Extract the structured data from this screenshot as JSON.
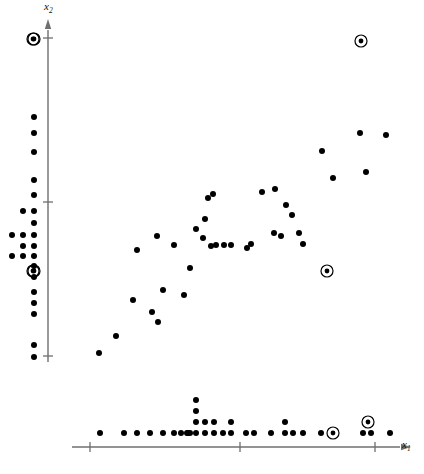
{
  "figure": {
    "title": "",
    "axis_labels": {
      "x": "x",
      "x_sub": "1",
      "y": "x",
      "y_sub": "2"
    },
    "colors": {
      "point": "#000000",
      "axis": "#6f6f6f",
      "tick": "#6f6f6f",
      "background": "#ffffff",
      "outlier_ring": "#000000"
    }
  },
  "chart_data": {
    "type": "scatter",
    "title": "",
    "xlabel": "x1",
    "ylabel": "x2",
    "grid": false,
    "legend": null,
    "xlim": [
      0,
      424
    ],
    "ylim": [
      0,
      474
    ],
    "axes": {
      "y_axis_x_px": 48,
      "y_axis_top_px": 30,
      "y_axis_bottom_px": 362,
      "y_ticks_px": [
        38,
        202,
        356
      ],
      "x_axis_y_px": 447,
      "x_axis_left_px": 72,
      "x_axis_right_px": 400,
      "x_ticks_px": [
        90,
        240,
        375
      ]
    },
    "main_points": [
      {
        "x": 99,
        "y": 353,
        "outlier": false
      },
      {
        "x": 116,
        "y": 336,
        "outlier": false
      },
      {
        "x": 133,
        "y": 300,
        "outlier": false
      },
      {
        "x": 137,
        "y": 250,
        "outlier": false
      },
      {
        "x": 152,
        "y": 312,
        "outlier": false
      },
      {
        "x": 157,
        "y": 236,
        "outlier": false
      },
      {
        "x": 158,
        "y": 322,
        "outlier": false
      },
      {
        "x": 163,
        "y": 290,
        "outlier": false
      },
      {
        "x": 174,
        "y": 245,
        "outlier": false
      },
      {
        "x": 184,
        "y": 295,
        "outlier": false
      },
      {
        "x": 190,
        "y": 268,
        "outlier": false
      },
      {
        "x": 196,
        "y": 229,
        "outlier": false
      },
      {
        "x": 203,
        "y": 238,
        "outlier": false
      },
      {
        "x": 205,
        "y": 219,
        "outlier": false
      },
      {
        "x": 208,
        "y": 198,
        "outlier": false
      },
      {
        "x": 211,
        "y": 246,
        "outlier": false
      },
      {
        "x": 213,
        "y": 194,
        "outlier": false
      },
      {
        "x": 216,
        "y": 245,
        "outlier": false
      },
      {
        "x": 224,
        "y": 245,
        "outlier": false
      },
      {
        "x": 231,
        "y": 245,
        "outlier": false
      },
      {
        "x": 247,
        "y": 248,
        "outlier": false
      },
      {
        "x": 251,
        "y": 244,
        "outlier": false
      },
      {
        "x": 262,
        "y": 192,
        "outlier": false
      },
      {
        "x": 274,
        "y": 233,
        "outlier": false
      },
      {
        "x": 275,
        "y": 189,
        "outlier": false
      },
      {
        "x": 281,
        "y": 236,
        "outlier": false
      },
      {
        "x": 286,
        "y": 205,
        "outlier": false
      },
      {
        "x": 292,
        "y": 215,
        "outlier": false
      },
      {
        "x": 299,
        "y": 233,
        "outlier": false
      },
      {
        "x": 303,
        "y": 244,
        "outlier": false
      },
      {
        "x": 322,
        "y": 151,
        "outlier": false
      },
      {
        "x": 333,
        "y": 178,
        "outlier": false
      },
      {
        "x": 360,
        "y": 133,
        "outlier": false
      },
      {
        "x": 366,
        "y": 172,
        "outlier": false
      },
      {
        "x": 386,
        "y": 135,
        "outlier": false
      },
      {
        "x": 361,
        "y": 41,
        "outlier": true
      },
      {
        "x": 327,
        "y": 271,
        "outlier": true
      },
      {
        "x": 33,
        "y": 271,
        "outlier": true
      },
      {
        "x": 33,
        "y": 39,
        "outlier": true
      }
    ],
    "y_marginal_dots": [
      {
        "col": 0,
        "y": 39,
        "outlier": true
      },
      {
        "col": 0,
        "y": 117,
        "outlier": false
      },
      {
        "col": 0,
        "y": 133,
        "outlier": false
      },
      {
        "col": 0,
        "y": 152,
        "outlier": false
      },
      {
        "col": 0,
        "y": 180,
        "outlier": false
      },
      {
        "col": 0,
        "y": 195,
        "outlier": false
      },
      {
        "col": 1,
        "y": 211,
        "outlier": false
      },
      {
        "col": 0,
        "y": 211,
        "outlier": false
      },
      {
        "col": 0,
        "y": 223,
        "outlier": false
      },
      {
        "col": 0,
        "y": 235,
        "outlier": false
      },
      {
        "col": 1,
        "y": 235,
        "outlier": false
      },
      {
        "col": 2,
        "y": 235,
        "outlier": false
      },
      {
        "col": 0,
        "y": 246,
        "outlier": false
      },
      {
        "col": 1,
        "y": 246,
        "outlier": false
      },
      {
        "col": 0,
        "y": 256,
        "outlier": false
      },
      {
        "col": 1,
        "y": 256,
        "outlier": false
      },
      {
        "col": 2,
        "y": 256,
        "outlier": false
      },
      {
        "col": 0,
        "y": 266,
        "outlier": false
      },
      {
        "col": 0,
        "y": 277,
        "outlier": false
      },
      {
        "col": 0,
        "y": 271,
        "outlier": true
      },
      {
        "col": 0,
        "y": 292,
        "outlier": false
      },
      {
        "col": 0,
        "y": 303,
        "outlier": false
      },
      {
        "col": 0,
        "y": 314,
        "outlier": false
      },
      {
        "col": 0,
        "y": 345,
        "outlier": false
      },
      {
        "col": 0,
        "y": 357,
        "outlier": false
      }
    ],
    "x_marginal_dots": [
      {
        "x": 100,
        "row": 0,
        "outlier": false
      },
      {
        "x": 124,
        "row": 0,
        "outlier": false
      },
      {
        "x": 137,
        "row": 0,
        "outlier": false
      },
      {
        "x": 150,
        "row": 0,
        "outlier": false
      },
      {
        "x": 163,
        "row": 0,
        "outlier": false
      },
      {
        "x": 174,
        "row": 0,
        "outlier": false
      },
      {
        "x": 181,
        "row": 0,
        "outlier": false
      },
      {
        "x": 188,
        "row": 0,
        "outlier": false
      },
      {
        "x": 196,
        "row": 0,
        "outlier": false
      },
      {
        "x": 190,
        "row": 0,
        "outlier": false
      },
      {
        "x": 187,
        "row": 0,
        "outlier": false
      },
      {
        "x": 196,
        "row": 1,
        "outlier": false
      },
      {
        "x": 196,
        "row": 2,
        "outlier": false
      },
      {
        "x": 196,
        "row": 3,
        "outlier": false
      },
      {
        "x": 205,
        "row": 0,
        "outlier": false
      },
      {
        "x": 205,
        "row": 1,
        "outlier": false
      },
      {
        "x": 214,
        "row": 0,
        "outlier": false
      },
      {
        "x": 214,
        "row": 1,
        "outlier": false
      },
      {
        "x": 223,
        "row": 0,
        "outlier": false
      },
      {
        "x": 231,
        "row": 0,
        "outlier": false
      },
      {
        "x": 231,
        "row": 1,
        "outlier": false
      },
      {
        "x": 246,
        "row": 0,
        "outlier": false
      },
      {
        "x": 254,
        "row": 0,
        "outlier": false
      },
      {
        "x": 271,
        "row": 0,
        "outlier": false
      },
      {
        "x": 285,
        "row": 0,
        "outlier": false
      },
      {
        "x": 285,
        "row": 1,
        "outlier": false
      },
      {
        "x": 293,
        "row": 0,
        "outlier": false
      },
      {
        "x": 303,
        "row": 0,
        "outlier": false
      },
      {
        "x": 321,
        "row": 0,
        "outlier": false
      },
      {
        "x": 333,
        "row": 0,
        "outlier": true
      },
      {
        "x": 363,
        "row": 0,
        "outlier": false
      },
      {
        "x": 371,
        "row": 0,
        "outlier": false
      },
      {
        "x": 368,
        "row": 1,
        "outlier": true
      },
      {
        "x": 390,
        "row": 0,
        "outlier": false
      }
    ]
  }
}
